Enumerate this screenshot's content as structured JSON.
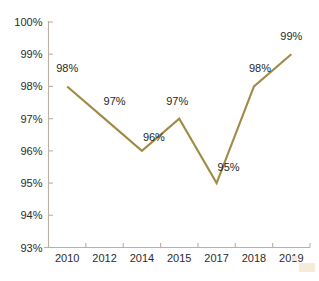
{
  "chart_data": {
    "type": "line",
    "title": "",
    "xlabel": "",
    "ylabel": "",
    "categories": [
      "2010",
      "2012",
      "2014",
      "2015",
      "2017",
      "2018",
      "2019"
    ],
    "values": [
      98,
      97,
      96,
      97,
      95,
      98,
      99
    ],
    "point_labels": [
      "98%",
      "97%",
      "96%",
      "97%",
      "95%",
      "98%",
      "99%"
    ],
    "ylim": [
      93,
      100
    ],
    "y_ticks": [
      93,
      94,
      95,
      96,
      97,
      98,
      99,
      100
    ],
    "y_tick_labels": [
      "93%",
      "94%",
      "95%",
      "96%",
      "97%",
      "98%",
      "99%",
      "100%"
    ],
    "grid": false,
    "legend": "none",
    "series": [
      {
        "name": "",
        "values": [
          98,
          97,
          96,
          97,
          95,
          98,
          99
        ],
        "color": "#a08b46"
      }
    ],
    "colors": {
      "line": "#a08b46",
      "axis": "#b9b2a4",
      "label_text": "#1f1f1f",
      "tick_text": "#2b2b2b",
      "background": "#ffffff"
    }
  },
  "figure": {
    "cropped_title_text": "",
    "corner_mark_color": "#f4ecd8"
  }
}
